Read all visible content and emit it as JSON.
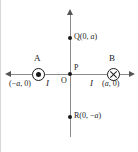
{
  "figure": {
    "axes": {
      "vertical_arrow": "arrow-up",
      "horizontal_arrow_right": "arrow-right",
      "horizontal_arrow_left": "arrow-left",
      "axis_color": "#8a8a8a"
    },
    "labels": {
      "wire_a_name": "A",
      "wire_b_name": "B",
      "origin": "O",
      "point_p": "P",
      "point_q": "Q(0, a)",
      "point_r": "R(0, −a)",
      "wire_a_coord": "(−a, 0)",
      "wire_a_current": "I",
      "wire_b_current": "I",
      "wire_b_coord": "(a, 0)"
    },
    "symbols": {
      "wire_a_symbol": "current-out-of-page-dot-in-circle",
      "wire_b_symbol": "current-into-page-cross-in-circle"
    },
    "colors": {
      "ink": "#1a1a1a",
      "axis": "#8a8a8a",
      "background": "#ffffff"
    }
  }
}
